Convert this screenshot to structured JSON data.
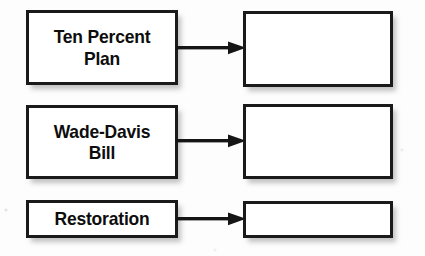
{
  "worksheet": {
    "background_color": "#fdfdfd",
    "border_color": "#1a1a1a",
    "text_color": "#0d0d0d",
    "rows": [
      {
        "term": "Ten Percent\nPlan",
        "answer": "",
        "arrow": "arrow-right-icon"
      },
      {
        "term": "Wade-Davis\nBill",
        "answer": "",
        "arrow": "arrow-right-icon"
      },
      {
        "term": "Restoration",
        "answer": "",
        "arrow": "arrow-right-icon"
      }
    ]
  }
}
